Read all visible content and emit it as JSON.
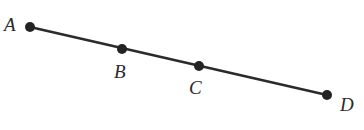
{
  "diagram": {
    "type": "collinear-points-on-line-segment",
    "line": {
      "from": "A",
      "to": "D",
      "color": "#2b2b2b"
    },
    "points": [
      {
        "name": "A",
        "label": "A",
        "x": 30,
        "y": 27,
        "label_x": 4,
        "label_y": 31
      },
      {
        "name": "B",
        "label": "B",
        "x": 122,
        "y": 49,
        "label_x": 114,
        "label_y": 78
      },
      {
        "name": "C",
        "label": "C",
        "x": 199,
        "y": 66,
        "label_x": 189,
        "label_y": 94
      },
      {
        "name": "D",
        "label": "D",
        "x": 327,
        "y": 95,
        "label_x": 340,
        "label_y": 111
      }
    ],
    "point_color": "#232323",
    "point_radius": 5
  }
}
